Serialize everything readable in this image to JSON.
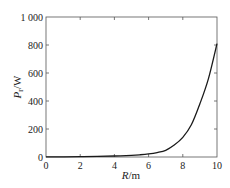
{
  "chart_data": {
    "type": "line",
    "title": "",
    "xlabel": "R/m",
    "xlabel_parts": {
      "var": "R",
      "unit": "/m"
    },
    "ylabel": "P_r/W",
    "ylabel_parts": {
      "var": "P",
      "sub": "r",
      "unit": "/W"
    },
    "xlim": [
      0,
      10
    ],
    "ylim": [
      0,
      1000
    ],
    "xticks": [
      0,
      2,
      4,
      6,
      8,
      10
    ],
    "xtick_labels": [
      "0",
      "2",
      "4",
      "6",
      "8",
      "10"
    ],
    "yticks": [
      0,
      200,
      400,
      600,
      800,
      1000
    ],
    "ytick_labels": [
      "0",
      "200",
      "400",
      "600",
      "800",
      "1 000"
    ],
    "grid": false,
    "legend": null,
    "series": [
      {
        "name": "P_r",
        "color": "#1a1a1a",
        "x": [
          0,
          1,
          2,
          3,
          4,
          5,
          5.5,
          6,
          6.5,
          7,
          7.5,
          8,
          8.5,
          9,
          9.5,
          10
        ],
        "y": [
          1,
          1.5,
          2.5,
          4,
          7,
          12,
          16,
          22,
          32,
          48,
          85,
          140,
          230,
          380,
          560,
          810
        ]
      }
    ]
  }
}
